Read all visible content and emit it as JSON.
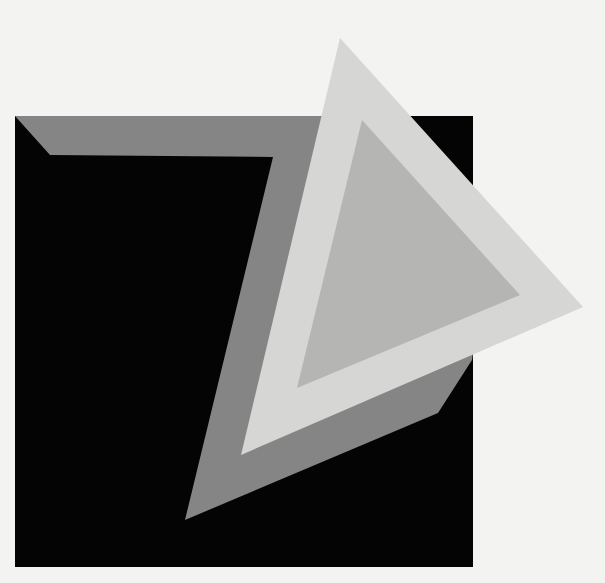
{
  "artwork": {
    "background": "#f3f3f2",
    "shapes": {
      "black_square": {
        "fill": "#040404",
        "points": "15,116 473,116 473,567 15,567"
      },
      "gray_band": {
        "fill": "#858585",
        "points": "15,116 335,116 480,300 472,360 438,413 185,520 273,157 50,155"
      },
      "outer_triangle": {
        "fill": "#d6d6d5",
        "points": "340,38 583,307 241,455"
      },
      "inner_triangle": {
        "fill": "#b5b5b4",
        "points": "362,120 520,295 297,388"
      }
    }
  }
}
